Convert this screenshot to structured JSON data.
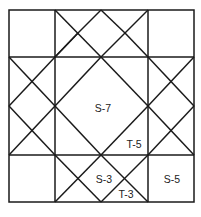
{
  "diagram": {
    "type": "quilt-block",
    "labels": [
      {
        "id": "S-7",
        "text": "S-7",
        "x": 103,
        "y": 112
      },
      {
        "id": "T-5",
        "text": "T-5",
        "x": 134,
        "y": 148
      },
      {
        "id": "S-3",
        "text": "S-3",
        "x": 104,
        "y": 183
      },
      {
        "id": "T-3",
        "text": "T-3",
        "x": 126,
        "y": 198
      },
      {
        "id": "S-5",
        "text": "S-5",
        "x": 172,
        "y": 183
      }
    ],
    "colors": {
      "line": "#1a1a1a",
      "background": "#ffffff"
    }
  }
}
